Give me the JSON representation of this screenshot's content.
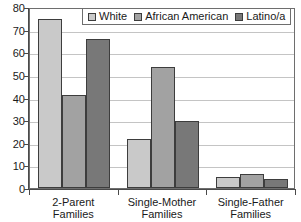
{
  "chart_data": {
    "type": "bar",
    "title": "",
    "subtitle": "",
    "xlabel": "",
    "ylabel": "",
    "ylim": [
      0,
      80
    ],
    "ytick_step": 10,
    "yticks": [
      0,
      10,
      20,
      30,
      40,
      50,
      60,
      70,
      80
    ],
    "grid": true,
    "grid_orientation": "horizontal",
    "legend_position": "top-center",
    "categories": [
      "2-Parent\nFamilies",
      "Single-Mother\nFamilies",
      "Single-Father\nFamilies"
    ],
    "category_lines": [
      [
        "2-Parent",
        "Families"
      ],
      [
        "Single-Mother",
        "Families"
      ],
      [
        "Single-Father",
        "Families"
      ]
    ],
    "series": [
      {
        "name": "White",
        "color": "#c9c9c9",
        "values": [
          74.5,
          21.5,
          5
        ]
      },
      {
        "name": "African American",
        "color": "#a2a2a2",
        "values": [
          41,
          53.5,
          6
        ]
      },
      {
        "name": "Latino/a",
        "color": "#787878",
        "values": [
          66,
          29.5,
          4
        ]
      }
    ]
  },
  "legend": {
    "entries": [
      {
        "label": "White",
        "color": "#c9c9c9"
      },
      {
        "label": "African American",
        "color": "#a2a2a2"
      },
      {
        "label": "Latino/a",
        "color": "#787878"
      }
    ]
  },
  "axis": {
    "y_labels": [
      "80",
      "70",
      "60",
      "50",
      "40",
      "30",
      "20",
      "10",
      "0"
    ]
  }
}
